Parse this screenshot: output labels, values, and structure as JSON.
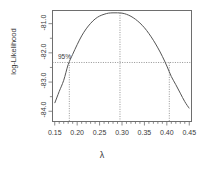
{
  "chart_data": {
    "type": "line",
    "title": "",
    "xlabel": "λ",
    "ylabel": "log-Likelihood",
    "xlim": [
      0.145,
      0.455
    ],
    "ylim": [
      -84.35,
      -80.55
    ],
    "grid": false,
    "legend": "none",
    "xticks": [
      0.15,
      0.2,
      0.25,
      0.3,
      0.35,
      0.4,
      0.45
    ],
    "xtick_labels": [
      "0.15",
      "0.20",
      "0.25",
      "0.30",
      "0.35",
      "0.40",
      "0.45"
    ],
    "xminor_step": 0.01,
    "yticks": [
      -81.0,
      -82.0,
      -83.0,
      -84.0
    ],
    "ytick_labels": [
      "-81.0",
      "-82.0",
      "-83.0",
      "-84.0"
    ],
    "yminor_ticks": [
      -80.5,
      -81.5,
      -82.5,
      -83.5
    ],
    "annotations": [
      {
        "text": "95%",
        "x": 0.175,
        "y": -82.17,
        "name": "confidence-level-label"
      }
    ],
    "reference_lines": [
      {
        "name": "ci-horizontal-line",
        "orientation": "horizontal",
        "y": -82.33,
        "style": "dotted"
      },
      {
        "name": "mle-vertical-line",
        "orientation": "vertical",
        "x": 0.2955,
        "style": "dotted"
      },
      {
        "name": "ci-lower-vertical-line",
        "orientation": "vertical",
        "x": 0.1825,
        "style": "dotted"
      },
      {
        "name": "ci-upper-vertical-line",
        "orientation": "vertical",
        "x": 0.4055,
        "style": "dotted"
      }
    ],
    "mle": 0.2955,
    "ci_lower": 0.1825,
    "ci_upper": 0.4055,
    "max_loglik": -80.63,
    "series": [
      {
        "name": "log-likelihood profile",
        "color": "#555555",
        "x": [
          0.15,
          0.16,
          0.17,
          0.18,
          0.19,
          0.2,
          0.21,
          0.22,
          0.23,
          0.24,
          0.25,
          0.26,
          0.27,
          0.28,
          0.29,
          0.3,
          0.31,
          0.32,
          0.33,
          0.34,
          0.35,
          0.36,
          0.37,
          0.38,
          0.39,
          0.4,
          0.41,
          0.42,
          0.43,
          0.44,
          0.45
        ],
        "y": [
          -83.72,
          -83.32,
          -82.94,
          -82.4,
          -82.05,
          -81.72,
          -81.42,
          -81.18,
          -80.99,
          -80.84,
          -80.74,
          -80.68,
          -80.64,
          -80.63,
          -80.63,
          -80.64,
          -80.68,
          -80.75,
          -80.85,
          -80.98,
          -81.14,
          -81.34,
          -81.57,
          -81.83,
          -82.12,
          -82.45,
          -82.81,
          -83.09,
          -83.38,
          -83.67,
          -83.9
        ]
      }
    ]
  }
}
